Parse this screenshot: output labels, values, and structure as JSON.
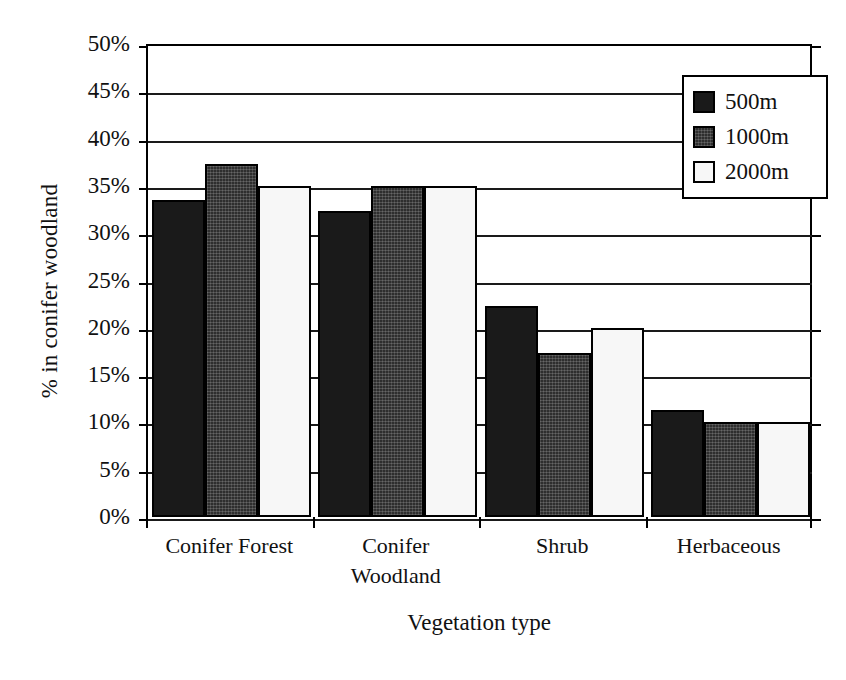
{
  "chart_data": {
    "type": "bar",
    "title": "",
    "xlabel": "Vegetation type",
    "ylabel": "% in conifer woodland",
    "categories": [
      "Conifer Forest",
      "Conifer Woodland",
      "Shrub",
      "Herbaceous"
    ],
    "category_lines": [
      [
        "Conifer Forest"
      ],
      [
        "Conifer",
        "Woodland"
      ],
      [
        "Shrub"
      ],
      [
        "Herbaceous"
      ]
    ],
    "series": [
      {
        "name": "500m",
        "values": [
          33.5,
          32.3,
          22.3,
          11.3
        ],
        "color": "#1a1a1a"
      },
      {
        "name": "1000m",
        "values": [
          37.3,
          35.0,
          17.3,
          10.0
        ],
        "color": "#2e2e2e"
      },
      {
        "name": "2000m",
        "values": [
          35.0,
          35.0,
          20.0,
          10.0
        ],
        "color": "#f7f7f7"
      }
    ],
    "ylim": [
      0,
      50
    ],
    "ytick_values": [
      0,
      5,
      10,
      15,
      20,
      25,
      30,
      35,
      40,
      45,
      50
    ],
    "ytick_labels": [
      "0%",
      "5%",
      "10%",
      "15%",
      "20%",
      "25%",
      "30%",
      "35%",
      "40%",
      "45%",
      "50%"
    ],
    "grid": "horizontal",
    "grid_step": 5,
    "legend_position": "top-right",
    "legend_entries": [
      "500m",
      "1000m",
      "2000m"
    ]
  },
  "axes": {
    "y_title": "% in conifer woodland",
    "x_title": "Vegetation type"
  },
  "legend": {
    "items": [
      {
        "label": "500m"
      },
      {
        "label": "1000m"
      },
      {
        "label": "2000m"
      }
    ]
  }
}
